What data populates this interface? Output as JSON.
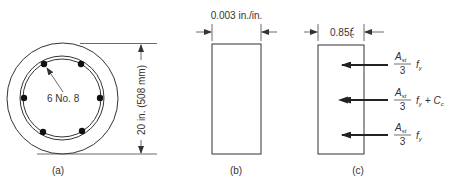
{
  "figure": {
    "panel_a": {
      "label": "(a)",
      "bar_note": "6 No. 8",
      "dimension": "20 in. (508 mm)",
      "bars": [
        {
          "cx": 44,
          "cy": 64
        },
        {
          "cx": 81,
          "cy": 64
        },
        {
          "cx": 24,
          "cy": 98
        },
        {
          "cx": 100,
          "cy": 98
        },
        {
          "cx": 43,
          "cy": 132
        },
        {
          "cx": 82,
          "cy": 131
        }
      ]
    },
    "panel_b": {
      "label": "(b)",
      "strain": "0.003 in./in."
    },
    "panel_c": {
      "label": "(c)",
      "stress_prefix": "0.85",
      "stress_f": "f",
      "stress_prime": "′",
      "stress_sub": "c",
      "forces": [
        {
          "num": "A",
          "num_sub": "st",
          "den": "3",
          "term": "f",
          "term_sub": "y",
          "extra": "",
          "extra_sub": ""
        },
        {
          "num": "A",
          "num_sub": "st",
          "den": "3",
          "term": "f",
          "term_sub": "y",
          "extra": "+ C",
          "extra_sub": "c"
        },
        {
          "num": "A",
          "num_sub": "st",
          "den": "3",
          "term": "f",
          "term_sub": "y",
          "extra": "",
          "extra_sub": ""
        }
      ]
    },
    "colors": {
      "line": "#333333",
      "bar": "#111111"
    }
  }
}
